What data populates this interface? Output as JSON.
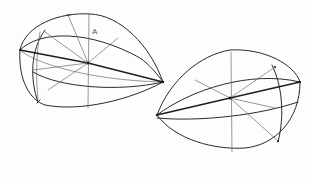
{
  "figure": {
    "shapes": [
      {
        "name": "left-form",
        "orientation": "pointed end to the right",
        "center": [
          88,
          63
        ],
        "tip": [
          163,
          82
        ],
        "label": "A"
      },
      {
        "name": "right-form",
        "orientation": "pointed end to the left",
        "center": [
          230,
          98
        ],
        "tip": [
          157,
          115
        ]
      }
    ],
    "label_a": "A",
    "caption": "· · · · ·",
    "colors": {
      "background": "#fdfdfd",
      "ink": "#2a2a2a",
      "construction": "#6b6b6b"
    }
  }
}
